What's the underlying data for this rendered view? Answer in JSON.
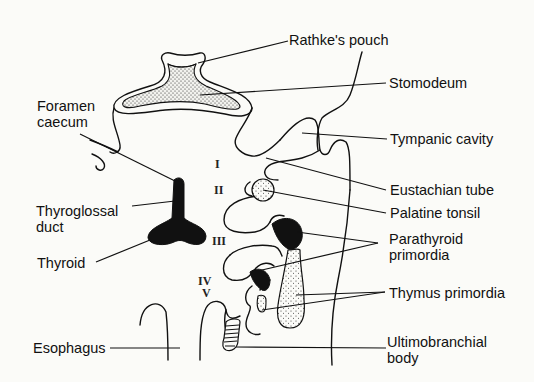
{
  "figure": {
    "colors": {
      "ink": "#111111",
      "paper": "#fbfbf8",
      "stipple": "#444444"
    }
  },
  "labels": {
    "rathkes_pouch": "Rathke's pouch",
    "stomodeum": "Stomodeum",
    "foramen_caecum": "Foramen\ncaecum",
    "tympanic_cavity": "Tympanic cavity",
    "eustachian_tube": "Eustachian tube",
    "palatine_tonsil": "Palatine tonsil",
    "thyroglossal_duct": "Thyroglossal\nduct",
    "parathyroid_primordia": "Parathyroid\nprimordia",
    "thyroid": "Thyroid",
    "thymus_primordia": "Thymus primordia",
    "esophagus": "Esophagus",
    "ultimobranchial_body": "Ultimobranchial\nbody"
  },
  "pouches": {
    "i": "I",
    "ii": "II",
    "iii": "III",
    "iv": "IV",
    "v": "V"
  }
}
